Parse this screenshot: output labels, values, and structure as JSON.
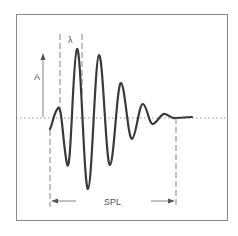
{
  "diagram": {
    "labels": {
      "amplitude": "A",
      "wavelength": "λ",
      "spatial_pulse_length": "SPL"
    },
    "colors": {
      "waveform": "#3a3a3a",
      "guides": "#666666",
      "frame": "#8a8a8a",
      "baseline": "#777777"
    }
  }
}
